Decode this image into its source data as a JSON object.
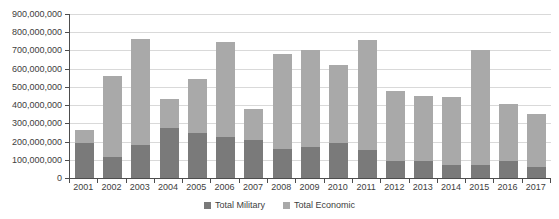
{
  "chart_data": {
    "type": "bar",
    "stacked": true,
    "title": "",
    "xlabel": "",
    "ylabel": "",
    "grid": true,
    "legend_position": "bottom",
    "ylim": [
      0,
      900000000
    ],
    "y_tick_step": 100000000,
    "y_tick_labels": [
      "0",
      "100,000,000",
      "200,000,000",
      "300,000,000",
      "400,000,000",
      "500,000,000",
      "600,000,000",
      "700,000,000",
      "800,000,000",
      "900,000,000"
    ],
    "categories": [
      "2001",
      "2002",
      "2003",
      "2004",
      "2005",
      "2006",
      "2007",
      "2008",
      "2009",
      "2010",
      "2011",
      "2012",
      "2013",
      "2014",
      "2015",
      "2016",
      "2017"
    ],
    "series": [
      {
        "name": "Total Military",
        "color": "#7a7a7a",
        "values": [
          190000000,
          113000000,
          182000000,
          273000000,
          249000000,
          224000000,
          209000000,
          160000000,
          172000000,
          191000000,
          156000000,
          93000000,
          91000000,
          70000000,
          72000000,
          95000000,
          62000000
        ]
      },
      {
        "name": "Total Economic",
        "color": "#a9a9a9",
        "values": [
          75000000,
          447000000,
          580000000,
          162000000,
          293000000,
          521000000,
          171000000,
          518000000,
          528000000,
          429000000,
          604000000,
          384000000,
          361000000,
          375000000,
          633000000,
          313000000,
          291000000
        ]
      }
    ],
    "colors": {
      "gridline": "#d9d9d9",
      "axis": "#4d4d4d",
      "tick_text": "#404040",
      "background": "#ffffff"
    }
  }
}
